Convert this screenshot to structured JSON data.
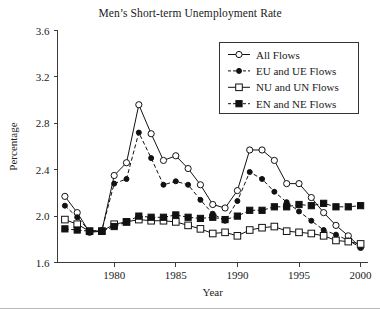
{
  "chart_data": {
    "type": "line",
    "title": "Men’s Short-term Unemployment Rate",
    "xlabel": "Year",
    "ylabel": "Percentage",
    "xlim": [
      1975.4,
      2000.6
    ],
    "ylim": [
      1.6,
      3.6
    ],
    "yticks": [
      "1.6",
      "2.0",
      "2.4",
      "2.8",
      "3.2",
      "3.6"
    ],
    "ytick_values": [
      1.6,
      2.0,
      2.4,
      2.8,
      3.2,
      3.6
    ],
    "xticks": [
      "1980",
      "1985",
      "1990",
      "1995",
      "2000"
    ],
    "xtick_values": [
      1980,
      1985,
      1990,
      1995,
      2000
    ],
    "grid": false,
    "legend_position": "top-right",
    "x": [
      1976,
      1977,
      1978,
      1979,
      1980,
      1981,
      1982,
      1983,
      1984,
      1985,
      1986,
      1987,
      1988,
      1989,
      1990,
      1991,
      1992,
      1993,
      1994,
      1995,
      1996,
      1997,
      1998,
      1999,
      2000
    ],
    "series": [
      {
        "name": "All Flows",
        "marker": "open-circle",
        "linestyle": "solid",
        "values": [
          2.17,
          2.03,
          1.86,
          1.87,
          2.35,
          2.46,
          2.96,
          2.71,
          2.48,
          2.52,
          2.41,
          2.27,
          2.1,
          2.07,
          2.22,
          2.57,
          2.57,
          2.48,
          2.28,
          2.28,
          2.16,
          2.03,
          1.92,
          1.83,
          1.73
        ]
      },
      {
        "name": "EU and UE Flows",
        "marker": "filled-circle",
        "linestyle": "dashed",
        "values": [
          2.09,
          1.99,
          1.87,
          1.88,
          2.28,
          2.32,
          2.72,
          2.5,
          2.27,
          2.3,
          2.27,
          2.14,
          2.02,
          1.96,
          2.13,
          2.38,
          2.32,
          2.21,
          2.12,
          2.04,
          1.96,
          1.88,
          1.84,
          1.79,
          1.73
        ]
      },
      {
        "name": "NU and UN Flows",
        "marker": "open-square",
        "linestyle": "solid",
        "values": [
          1.97,
          1.93,
          1.87,
          1.87,
          1.93,
          1.95,
          1.97,
          1.96,
          1.96,
          1.95,
          1.92,
          1.89,
          1.85,
          1.86,
          1.83,
          1.88,
          1.9,
          1.91,
          1.87,
          1.86,
          1.85,
          1.83,
          1.79,
          1.78,
          1.76
        ]
      },
      {
        "name": "EN and NE Flows",
        "marker": "filled-square",
        "linestyle": "dashed",
        "values": [
          1.89,
          1.88,
          1.87,
          1.87,
          1.91,
          1.95,
          2.0,
          1.99,
          1.99,
          2.01,
          1.99,
          1.98,
          1.99,
          1.97,
          2.0,
          2.05,
          2.05,
          2.08,
          2.08,
          2.1,
          2.09,
          2.11,
          2.08,
          2.08,
          2.09
        ]
      }
    ]
  },
  "legend": {
    "items": [
      {
        "label": "All Flows"
      },
      {
        "label": "EU and UE Flows"
      },
      {
        "label": "NU and UN Flows"
      },
      {
        "label": "EN and NE Flows"
      }
    ]
  }
}
